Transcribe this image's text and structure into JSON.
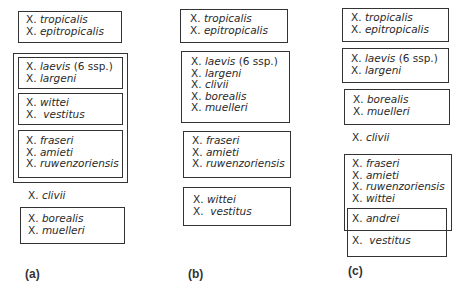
{
  "figure": {
    "panels": [
      {
        "label": "(a)",
        "groups": [
          {
            "species": [
              "X. tropicalis",
              "X. epitropicalis"
            ]
          },
          {
            "outer_group": [
              {
                "species": [
                  "X. laevis (6 ssp.)",
                  "X. largeni"
                ]
              },
              {
                "species": [
                  "X. wittei",
                  "X. vestitus"
                ]
              },
              {
                "species": [
                  "X. fraseri",
                  "X. amieti",
                  "X. ruwenzoriensis"
                ]
              }
            ]
          },
          {
            "ungrouped": "X. clivii"
          },
          {
            "species": [
              "X. borealis",
              "X. muelleri"
            ]
          }
        ]
      },
      {
        "label": "(b)",
        "groups": [
          {
            "species": [
              "X. tropicalis",
              "X. epitropicalis"
            ]
          },
          {
            "species": [
              "X. laevis (6 ssp.)",
              "X. largeni",
              "X. clivii",
              "X. borealis",
              "X. muelleri"
            ]
          },
          {
            "species": [
              "X. fraseri",
              "X. amieti",
              "X. ruwenzoriensis"
            ]
          },
          {
            "species": [
              "X. wittei",
              "X. vestitus"
            ]
          }
        ]
      },
      {
        "label": "(c)",
        "groups": [
          {
            "species": [
              "X. tropicalis",
              "X. epitropicalis"
            ]
          },
          {
            "species": [
              "X. laevis (6 ssp.)",
              "X. largeni"
            ]
          },
          {
            "species": [
              "X. borealis",
              "X. muelleri"
            ]
          },
          {
            "ungrouped": "X. clivii"
          },
          {
            "overlapping_groups": [
              {
                "species": [
                  "X. fraseri",
                  "X. amieti",
                  "X. ruwenzoriensis",
                  "X. wittei",
                  "X. andrei"
                ]
              },
              {
                "species": [
                  "X. andrei",
                  "X. vestitus"
                ]
              }
            ]
          }
        ]
      }
    ]
  },
  "a": {
    "g1": [
      "X.",
      "tropicalis",
      "X.",
      "epitropicalis"
    ],
    "g2": [
      "X.",
      "laevis",
      "(6 ssp.)",
      "X.",
      "largeni"
    ],
    "g3": [
      "X.",
      "wittei",
      "X.",
      "vestitus"
    ],
    "g4": [
      "X.",
      "fraseri",
      "X.",
      "amieti",
      "X.",
      "ruwenzoriensis"
    ],
    "clivii": [
      "X.",
      "clivii"
    ],
    "g5": [
      "X.",
      "borealis",
      "X.",
      "muelleri"
    ],
    "label": "(a)"
  },
  "b": {
    "g1": [
      "X.",
      "tropicalis",
      "X.",
      "epitropicalis"
    ],
    "g2": [
      "X.",
      "laevis",
      "(6 ssp.)",
      "X.",
      "largeni",
      "X.",
      "clivii",
      "X.",
      "borealis",
      "X.",
      "muelleri"
    ],
    "g3": [
      "X.",
      "fraseri",
      "X.",
      "amieti",
      "X.",
      "ruwenzoriensis"
    ],
    "g4": [
      "X.",
      "wittei",
      "X.",
      "vestitus"
    ],
    "label": "(b)"
  },
  "c": {
    "g1": [
      "X.",
      "tropicalis",
      "X.",
      "epitropicalis"
    ],
    "g2": [
      "X.",
      "laevis",
      "(6 ssp.)",
      "X.",
      "largeni"
    ],
    "g3": [
      "X.",
      "borealis",
      "X.",
      "muelleri"
    ],
    "clivii": [
      "X.",
      "clivii"
    ],
    "g4": [
      "X.",
      "fraseri",
      "X.",
      "amieti",
      "X.",
      "ruwenzoriensis",
      "X.",
      "wittei"
    ],
    "andrei": [
      "X.",
      "andrei"
    ],
    "vestitus": [
      "X.",
      "vestitus"
    ],
    "label": "(c)"
  }
}
